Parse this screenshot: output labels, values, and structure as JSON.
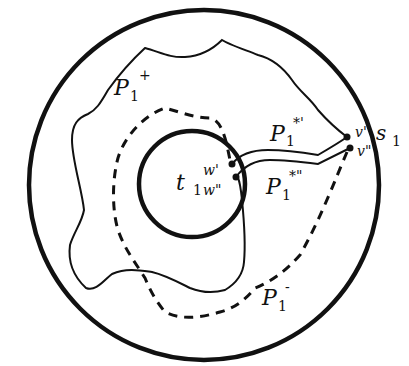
{
  "diagram": {
    "type": "topological-path-diagram",
    "colors": {
      "stroke": "#111111",
      "background": "#ffffff"
    },
    "outer_circle": {
      "name": "outer-boundary-circle",
      "cx": 204,
      "cy": 185,
      "r": 175
    },
    "inner_circle": {
      "name": "inner-hole-circle",
      "cx": 192,
      "cy": 184,
      "r": 53
    },
    "points": {
      "w_prime": {
        "label": "w'",
        "x": 232,
        "y": 164
      },
      "w_dprime": {
        "label": "w\"",
        "x": 236,
        "y": 177
      },
      "v_prime": {
        "label": "v'",
        "x": 347,
        "y": 137
      },
      "v_dprime": {
        "label": "v\"",
        "x": 350,
        "y": 148
      }
    },
    "labels": {
      "P1_plus": {
        "base": "P",
        "sub": "1",
        "sup": "+"
      },
      "P1_minus": {
        "base": "P",
        "sub": "1",
        "sup": "-"
      },
      "P1_star_prime": {
        "base": "P",
        "sub": "1",
        "sup": "*'"
      },
      "P1_star_dprime": {
        "base": "P",
        "sub": "1",
        "sup": "*\""
      },
      "t1": {
        "base": "t",
        "sub": "1"
      },
      "w_prime": "w'",
      "w_dprime": "w\"",
      "v_prime": "v'",
      "v_dprime": "v\"",
      "s1": {
        "base": "s",
        "sub": "1"
      }
    },
    "curves": [
      {
        "name": "P1-plus",
        "style": "solid-thin",
        "description": "wavy closed loop from v' around inner circle to w\""
      },
      {
        "name": "P1-minus",
        "style": "dashed",
        "description": "dashed loop from v\" around inner circle to w'"
      },
      {
        "name": "P1-star-prime",
        "style": "solid-thin",
        "description": "path from w' to v'"
      },
      {
        "name": "P1-star-dprime",
        "style": "solid-thin",
        "description": "path from w\" to v\""
      }
    ]
  }
}
